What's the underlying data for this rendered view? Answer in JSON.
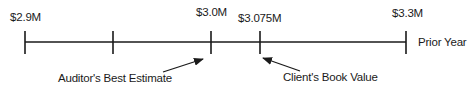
{
  "number_line": {
    "ticks": [
      {
        "x": 25,
        "label": "$2.9M"
      },
      {
        "x": 113,
        "label": ""
      },
      {
        "x": 211,
        "label": "$3.0M"
      },
      {
        "x": 260,
        "label": "$3.075M"
      },
      {
        "x": 406,
        "label": "$3.3M"
      }
    ],
    "end_label": "Prior Year"
  },
  "annotations": {
    "auditor": {
      "label": "Auditor's Best Estimate",
      "points_to": "$3.0M"
    },
    "client": {
      "label": "Client's Book Value",
      "points_to": "$3.075M"
    }
  },
  "colors": {
    "line": "#1a1a1a",
    "text": "#1a1a1a",
    "background": "#ffffff"
  }
}
